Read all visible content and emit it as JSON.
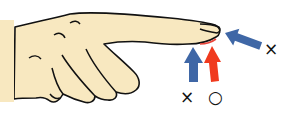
{
  "diagram": {
    "colors": {
      "skin": "#F8E8C0",
      "outline": "#111111",
      "wrong_arrow": "#3F67A6",
      "correct_arrow": "#F03A1E",
      "contact_highlight": "#E8443A"
    },
    "markers": {
      "tip_wrong": "×",
      "underside_wrong": "×",
      "pad_correct": "○"
    },
    "arrows": [
      {
        "id": "fingertip-arrow",
        "direction": "from right-below toward fingertip nail",
        "verdict": "wrong"
      },
      {
        "id": "underside-arrow",
        "direction": "from below toward finger underside",
        "verdict": "wrong"
      },
      {
        "id": "pad-arrow",
        "direction": "from below toward fingertip pad",
        "verdict": "correct"
      }
    ]
  }
}
